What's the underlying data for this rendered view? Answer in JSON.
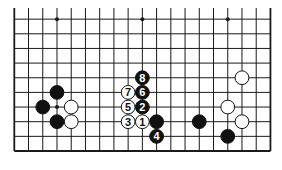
{
  "diagram": {
    "type": "go-board",
    "board_size": 19,
    "visible_rows_from_bottom": 10,
    "colors": {
      "line": "#1a1a1a",
      "black_stone": "#111111",
      "white_stone": "#ffffff",
      "background": "#ffffff"
    },
    "hoshi": [
      {
        "col": 4,
        "row": 10
      },
      {
        "col": 10,
        "row": 10
      },
      {
        "col": 16,
        "row": 10
      },
      {
        "col": 4,
        "row": 4
      }
    ],
    "stones": [
      {
        "color": "black",
        "col": 4,
        "row": 5,
        "label": ""
      },
      {
        "color": "black",
        "col": 3,
        "row": 4,
        "label": ""
      },
      {
        "color": "white",
        "col": 5,
        "row": 4,
        "label": ""
      },
      {
        "color": "black",
        "col": 4,
        "row": 3,
        "label": ""
      },
      {
        "color": "white",
        "col": 5,
        "row": 3,
        "label": ""
      },
      {
        "color": "black",
        "col": 11,
        "row": 3,
        "label": ""
      },
      {
        "color": "white",
        "col": 17,
        "row": 6,
        "label": ""
      },
      {
        "color": "white",
        "col": 16,
        "row": 4,
        "label": ""
      },
      {
        "color": "black",
        "col": 14,
        "row": 3,
        "label": ""
      },
      {
        "color": "white",
        "col": 17,
        "row": 3,
        "label": ""
      },
      {
        "color": "black",
        "col": 16,
        "row": 2,
        "label": ""
      },
      {
        "color": "white",
        "col": 10,
        "row": 3,
        "label": "1"
      },
      {
        "color": "black",
        "col": 10,
        "row": 4,
        "label": "2"
      },
      {
        "color": "white",
        "col": 9,
        "row": 3,
        "label": "3"
      },
      {
        "color": "black",
        "col": 11,
        "row": 2,
        "label": "4"
      },
      {
        "color": "white",
        "col": 9,
        "row": 4,
        "label": "5"
      },
      {
        "color": "black",
        "col": 10,
        "row": 5,
        "label": "6"
      },
      {
        "color": "white",
        "col": 9,
        "row": 5,
        "label": "7"
      },
      {
        "color": "black",
        "col": 10,
        "row": 6,
        "label": "8"
      }
    ]
  }
}
